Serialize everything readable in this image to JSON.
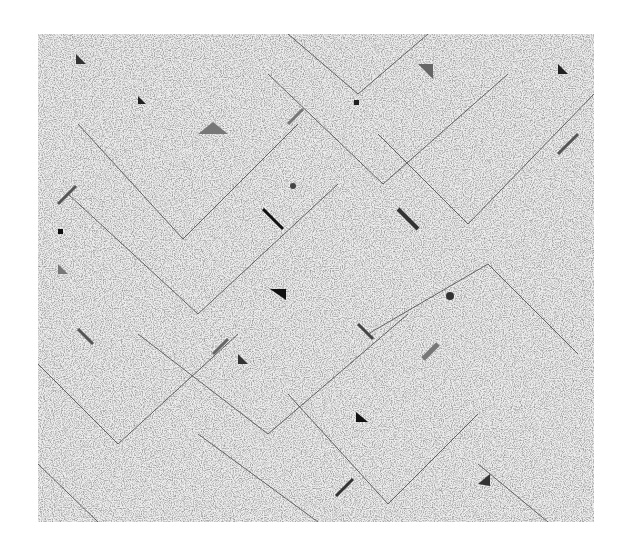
{
  "image": {
    "width": 624,
    "height": 553,
    "background": "#ffffff",
    "panel": {
      "x": 38,
      "y": 34,
      "width": 556,
      "height": 488,
      "base_color": "#eeeeee",
      "noise_color": "#555555"
    },
    "line_color": "#444444",
    "chevrons": [
      {
        "points": "250,0 320,60 390,0"
      },
      {
        "points": "40,90 145,205 260,90"
      },
      {
        "points": "30,160 160,280 300,150"
      },
      {
        "points": "230,40 345,150 470,40"
      },
      {
        "points": "340,100 430,190 556,60"
      },
      {
        "points": "100,300 230,400 370,280"
      },
      {
        "points": "0,330 80,410 200,300"
      },
      {
        "points": "330,300 450,230 540,320"
      },
      {
        "points": "250,360 350,470 440,380"
      },
      {
        "points": "0,430 60,488"
      },
      {
        "points": "440,430 510,488"
      },
      {
        "points": "160,400 280,488"
      }
    ],
    "shapes": [
      {
        "type": "tri",
        "points": "38,20 48,30 38,30",
        "fill": "#333"
      },
      {
        "type": "tri",
        "points": "160,100 175,88 190,100",
        "fill": "#777"
      },
      {
        "type": "tri",
        "points": "100,62 108,70 100,70",
        "fill": "#222"
      },
      {
        "type": "tri",
        "points": "232,255 248,255 248,266",
        "fill": "#111"
      },
      {
        "type": "tri",
        "points": "318,378 330,388 318,388",
        "fill": "#111"
      },
      {
        "type": "tri",
        "points": "440,450 452,440 452,452",
        "fill": "#333"
      },
      {
        "type": "tri",
        "points": "380,30 395,45 395,30",
        "fill": "#666"
      },
      {
        "type": "tri",
        "points": "520,30 530,40 520,40",
        "fill": "#222"
      },
      {
        "type": "tri",
        "points": "20,230 30,240 20,240",
        "fill": "#777"
      },
      {
        "type": "tri",
        "points": "200,320 210,330 200,330",
        "fill": "#333"
      },
      {
        "type": "rect",
        "x": 20,
        "y": 195,
        "w": 5,
        "h": 5,
        "fill": "#111"
      },
      {
        "type": "rect",
        "x": 316,
        "y": 66,
        "w": 5,
        "h": 5,
        "fill": "#222"
      },
      {
        "type": "circle",
        "cx": 255,
        "cy": 152,
        "r": 3,
        "fill": "#444"
      },
      {
        "type": "circle",
        "cx": 412,
        "cy": 262,
        "r": 4,
        "fill": "#333"
      },
      {
        "type": "line",
        "x1": 225,
        "y1": 175,
        "x2": 245,
        "y2": 195,
        "stroke": "#111",
        "w": 3
      },
      {
        "type": "line",
        "x1": 20,
        "y1": 170,
        "x2": 38,
        "y2": 152,
        "stroke": "#555",
        "w": 3
      },
      {
        "type": "line",
        "x1": 360,
        "y1": 175,
        "x2": 380,
        "y2": 195,
        "stroke": "#333",
        "w": 4
      },
      {
        "type": "line",
        "x1": 520,
        "y1": 120,
        "x2": 540,
        "y2": 100,
        "stroke": "#555",
        "w": 3
      },
      {
        "type": "line",
        "x1": 250,
        "y1": 90,
        "x2": 265,
        "y2": 75,
        "stroke": "#777",
        "w": 3
      },
      {
        "type": "line",
        "x1": 385,
        "y1": 325,
        "x2": 400,
        "y2": 310,
        "stroke": "#777",
        "w": 5
      },
      {
        "type": "line",
        "x1": 298,
        "y1": 462,
        "x2": 315,
        "y2": 445,
        "stroke": "#333",
        "w": 3
      },
      {
        "type": "line",
        "x1": 40,
        "y1": 295,
        "x2": 55,
        "y2": 310,
        "stroke": "#555",
        "w": 3
      },
      {
        "type": "line",
        "x1": 320,
        "y1": 290,
        "x2": 335,
        "y2": 305,
        "stroke": "#444",
        "w": 3
      },
      {
        "type": "line",
        "x1": 175,
        "y1": 320,
        "x2": 190,
        "y2": 305,
        "stroke": "#666",
        "w": 3
      }
    ]
  }
}
